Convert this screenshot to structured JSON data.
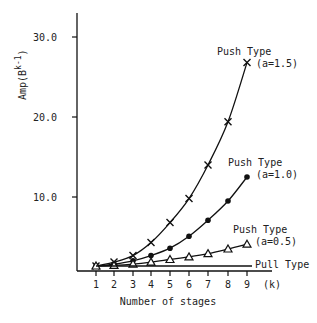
{
  "chart_data": {
    "type": "line",
    "title": "",
    "xlabel": "Number of stages",
    "x_unit_label": "(k)",
    "ylabel": "Amp(B",
    "ylabel_superscript": "k-1",
    "ylabel_close": ")",
    "x": [
      1,
      2,
      3,
      4,
      5,
      6,
      7,
      8,
      9
    ],
    "xticks": [
      "1",
      "2",
      "3",
      "4",
      "5",
      "6",
      "7",
      "8",
      "9"
    ],
    "yticks": [
      {
        "value": 10,
        "label": "10.0"
      },
      {
        "value": 20,
        "label": "20.0"
      },
      {
        "value": 30,
        "label": "30.0"
      }
    ],
    "xlim": [
      0,
      10
    ],
    "ylim": [
      0,
      33
    ],
    "grid": false,
    "legend": "inline labels at line ends",
    "series": [
      {
        "name": "Push Type (a=1.5)",
        "label_line1": "Push Type",
        "label_line2": "(a=1.5)",
        "marker": "x",
        "values": [
          1.0,
          1.6,
          2.6,
          4.3,
          6.8,
          9.8,
          14.0,
          19.4,
          26.8
        ]
      },
      {
        "name": "Push Type (a=1.0)",
        "label_line1": "Push Type",
        "label_line2": "(a=1.0)",
        "marker": "dot",
        "values": [
          1.0,
          1.3,
          1.8,
          2.6,
          3.6,
          5.1,
          7.1,
          9.5,
          12.5
        ]
      },
      {
        "name": "Push Type (a=0.5)",
        "label_line1": "Push Type",
        "label_line2": "(a=0.5)",
        "marker": "triangle",
        "values": [
          1.0,
          1.1,
          1.3,
          1.6,
          2.0,
          2.4,
          2.9,
          3.5,
          4.1
        ]
      },
      {
        "name": "Pull Type",
        "label_line1": "Pull Type",
        "label_line2": "",
        "marker": "none",
        "values": [
          1.0,
          1.0,
          1.0,
          1.0,
          1.0,
          1.0,
          1.0,
          1.0,
          1.0
        ]
      }
    ]
  }
}
